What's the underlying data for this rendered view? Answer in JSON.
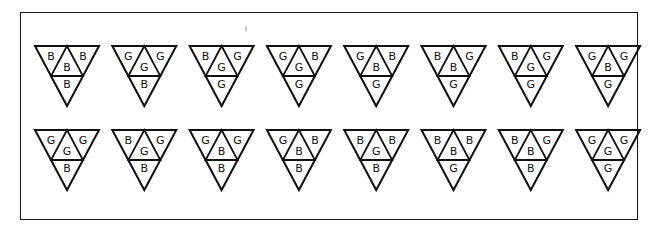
{
  "title": "",
  "cell_order": [
    "left",
    "center",
    "right",
    "bottom"
  ],
  "rows": [
    {
      "triangles": [
        {
          "left": "B",
          "center": "B",
          "right": "B",
          "bottom": "B"
        },
        {
          "left": "G",
          "center": "G",
          "right": "G",
          "bottom": "B"
        },
        {
          "left": "B",
          "center": "G",
          "right": "G",
          "bottom": "G"
        },
        {
          "left": "G",
          "center": "G",
          "right": "B",
          "bottom": "G"
        },
        {
          "left": "G",
          "center": "B",
          "right": "B",
          "bottom": "G"
        },
        {
          "left": "B",
          "center": "B",
          "right": "G",
          "bottom": "G"
        },
        {
          "left": "B",
          "center": "G",
          "right": "G",
          "bottom": "G"
        },
        {
          "left": "G",
          "center": "B",
          "right": "G",
          "bottom": "G"
        }
      ]
    },
    {
      "triangles": [
        {
          "left": "G",
          "center": "G",
          "right": "G",
          "bottom": "B"
        },
        {
          "left": "B",
          "center": "G",
          "right": "G",
          "bottom": "B"
        },
        {
          "left": "G",
          "center": "B",
          "right": "G",
          "bottom": "B"
        },
        {
          "left": "G",
          "center": "B",
          "right": "B",
          "bottom": "B"
        },
        {
          "left": "B",
          "center": "G",
          "right": "B",
          "bottom": "B"
        },
        {
          "left": "B",
          "center": "B",
          "right": "B",
          "bottom": "G"
        },
        {
          "left": "B",
          "center": "B",
          "right": "G",
          "bottom": "B"
        },
        {
          "left": "G",
          "center": "G",
          "right": "G",
          "bottom": "G"
        }
      ]
    }
  ],
  "colors": {
    "ink": "#111111",
    "background": "#ffffff"
  }
}
